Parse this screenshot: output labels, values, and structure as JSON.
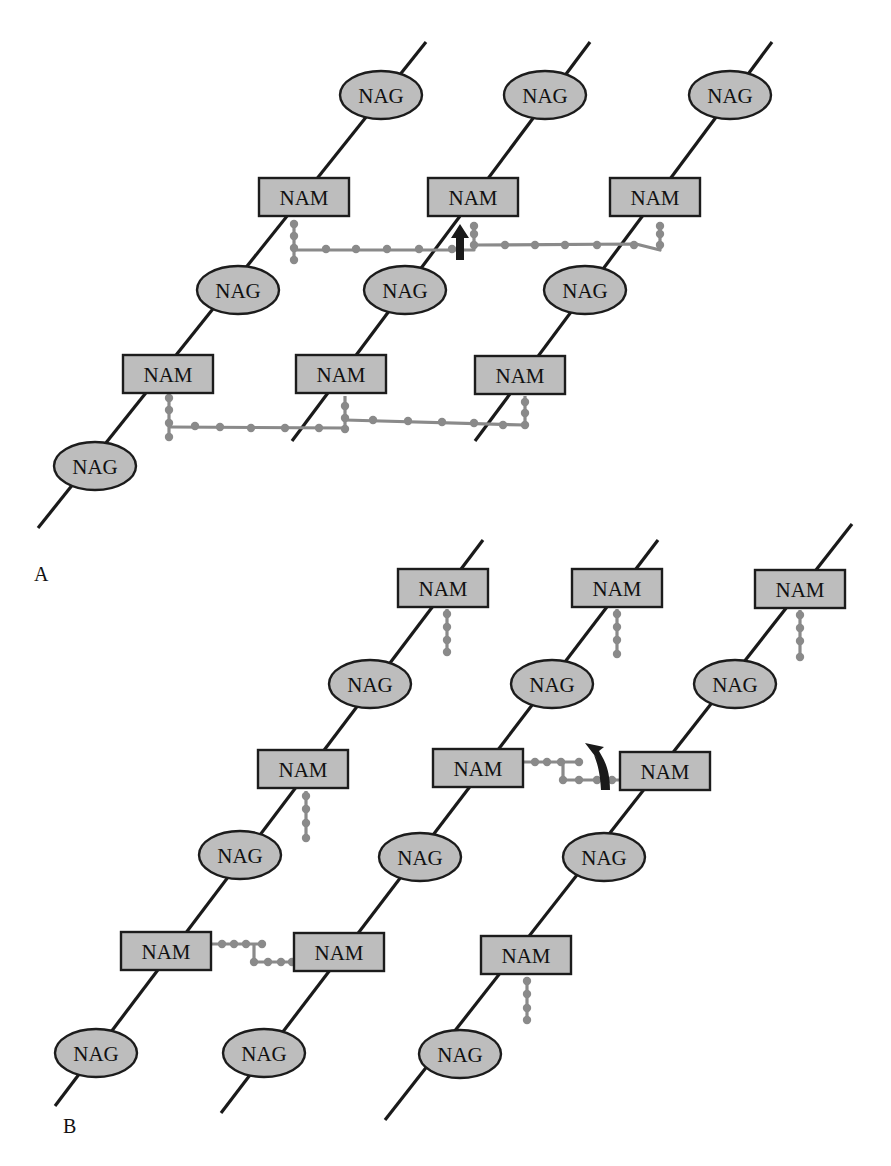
{
  "figure": {
    "panels": [
      {
        "id": "A",
        "label": "A",
        "label_pos": [
          34,
          575
        ],
        "strands": [
          {
            "from": [
              38,
              528
            ],
            "to": [
              426,
              42
            ]
          },
          {
            "from": [
              292,
              441
            ],
            "to": [
              590,
              42
            ]
          },
          {
            "from": [
              475,
              441
            ],
            "to": [
              772,
              42
            ]
          }
        ],
        "nodes": [
          {
            "type": "NAG",
            "text": "NAG",
            "cx": 381,
            "cy": 95
          },
          {
            "type": "NAG",
            "text": "NAG",
            "cx": 545,
            "cy": 95
          },
          {
            "type": "NAG",
            "text": "NAG",
            "cx": 730,
            "cy": 95
          },
          {
            "type": "NAM",
            "text": "NAM",
            "cx": 304,
            "cy": 197
          },
          {
            "type": "NAM",
            "text": "NAM",
            "cx": 473,
            "cy": 197
          },
          {
            "type": "NAM",
            "text": "NAM",
            "cx": 655,
            "cy": 197
          },
          {
            "type": "NAG",
            "text": "NAG",
            "cx": 238,
            "cy": 290
          },
          {
            "type": "NAG",
            "text": "NAG",
            "cx": 405,
            "cy": 290
          },
          {
            "type": "NAG",
            "text": "NAG",
            "cx": 585,
            "cy": 290
          },
          {
            "type": "NAM",
            "text": "NAM",
            "cx": 168,
            "cy": 374
          },
          {
            "type": "NAM",
            "text": "NAM",
            "cx": 341,
            "cy": 374
          },
          {
            "type": "NAM",
            "text": "NAM",
            "cx": 520,
            "cy": 375
          },
          {
            "type": "NAG",
            "text": "NAG",
            "cx": 95,
            "cy": 466
          }
        ],
        "peptides": [
          {
            "points": [
              [
                294,
                222
              ],
              [
                294,
                262
              ]
            ],
            "dots": [
              [
                294,
                224
              ],
              [
                294,
                236
              ],
              [
                294,
                248
              ],
              [
                294,
                260
              ]
            ]
          },
          {
            "points": [
              [
                294,
                250
              ],
              [
                474,
                250
              ],
              [
                474,
                222
              ]
            ],
            "dots": [
              [
                326,
                249
              ],
              [
                356,
                249
              ],
              [
                387,
                249
              ],
              [
                419,
                249
              ],
              [
                452,
                249
              ],
              [
                474,
                245
              ],
              [
                474,
                234
              ],
              [
                474,
                226
              ]
            ]
          },
          {
            "points": [
              [
                474,
                245
              ],
              [
                636,
                244
              ],
              [
                660,
                250
              ],
              [
                660,
                222
              ]
            ],
            "dots": [
              [
                505,
                245
              ],
              [
                535,
                245
              ],
              [
                565,
                245
              ],
              [
                597,
                245
              ],
              [
                634,
                245
              ],
              [
                660,
                245
              ],
              [
                660,
                234
              ],
              [
                660,
                226
              ]
            ]
          },
          {
            "points": [
              [
                169,
                395
              ],
              [
                169,
                437
              ]
            ],
            "dots": [
              [
                169,
                398
              ],
              [
                169,
                410
              ],
              [
                169,
                423
              ],
              [
                169,
                437
              ]
            ]
          },
          {
            "points": [
              [
                169,
                427
              ],
              [
                345,
                428
              ],
              [
                345,
                396
              ]
            ],
            "dots": [
              [
                195,
                426
              ],
              [
                220,
                427
              ],
              [
                251,
                428
              ],
              [
                285,
                428
              ],
              [
                319,
                428
              ],
              [
                345,
                429
              ],
              [
                345,
                418
              ],
              [
                345,
                406
              ]
            ]
          },
          {
            "points": [
              [
                345,
                420
              ],
              [
                525,
                425
              ],
              [
                525,
                396
              ]
            ],
            "dots": [
              [
                373,
                420
              ],
              [
                408,
                421
              ],
              [
                442,
                422
              ],
              [
                474,
                423
              ],
              [
                503,
                425
              ],
              [
                525,
                425
              ],
              [
                525,
                413
              ],
              [
                525,
                402
              ]
            ]
          }
        ],
        "arrows": [
          {
            "kind": "straight-up",
            "x": 460,
            "y": 224,
            "length": 36
          }
        ]
      },
      {
        "id": "B",
        "label": "B",
        "label_pos": [
          63,
          1127
        ],
        "strands": [
          {
            "from": [
              55,
              1106
            ],
            "to": [
              483,
              540
            ]
          },
          {
            "from": [
              221,
              1113
            ],
            "to": [
              658,
              540
            ]
          },
          {
            "from": [
              385,
              1120
            ],
            "to": [
              852,
              524
            ]
          }
        ],
        "nodes": [
          {
            "type": "NAM",
            "text": "NAM",
            "cx": 443,
            "cy": 588
          },
          {
            "type": "NAM",
            "text": "NAM",
            "cx": 617,
            "cy": 588
          },
          {
            "type": "NAM",
            "text": "NAM",
            "cx": 800,
            "cy": 589
          },
          {
            "type": "NAG",
            "text": "NAG",
            "cx": 370,
            "cy": 684
          },
          {
            "type": "NAG",
            "text": "NAG",
            "cx": 552,
            "cy": 684
          },
          {
            "type": "NAG",
            "text": "NAG",
            "cx": 735,
            "cy": 684
          },
          {
            "type": "NAM",
            "text": "NAM",
            "cx": 303,
            "cy": 769
          },
          {
            "type": "NAM",
            "text": "NAM",
            "cx": 478,
            "cy": 768
          },
          {
            "type": "NAM",
            "text": "NAM",
            "cx": 665,
            "cy": 771
          },
          {
            "type": "NAG",
            "text": "NAG",
            "cx": 240,
            "cy": 855
          },
          {
            "type": "NAG",
            "text": "NAG",
            "cx": 420,
            "cy": 857
          },
          {
            "type": "NAG",
            "text": "NAG",
            "cx": 604,
            "cy": 857
          },
          {
            "type": "NAM",
            "text": "NAM",
            "cx": 166,
            "cy": 951
          },
          {
            "type": "NAM",
            "text": "NAM",
            "cx": 339,
            "cy": 952
          },
          {
            "type": "NAM",
            "text": "NAM",
            "cx": 526,
            "cy": 955
          },
          {
            "type": "NAG",
            "text": "NAG",
            "cx": 96,
            "cy": 1053
          },
          {
            "type": "NAG",
            "text": "NAG",
            "cx": 264,
            "cy": 1053
          },
          {
            "type": "NAG",
            "text": "NAG",
            "cx": 460,
            "cy": 1054
          }
        ],
        "peptides": [
          {
            "points": [
              [
                447,
                609
              ],
              [
                447,
                652
              ]
            ],
            "dots": [
              [
                447,
                614
              ],
              [
                447,
                627
              ],
              [
                447,
                640
              ],
              [
                447,
                652
              ]
            ]
          },
          {
            "points": [
              [
                617,
                609
              ],
              [
                617,
                654
              ]
            ],
            "dots": [
              [
                617,
                614
              ],
              [
                617,
                627
              ],
              [
                617,
                640
              ],
              [
                617,
                654
              ]
            ]
          },
          {
            "points": [
              [
                800,
                610
              ],
              [
                800,
                657
              ]
            ],
            "dots": [
              [
                800,
                615
              ],
              [
                800,
                628
              ],
              [
                800,
                641
              ],
              [
                800,
                657
              ]
            ]
          },
          {
            "points": [
              [
                306,
                791
              ],
              [
                306,
                838
              ]
            ],
            "dots": [
              [
                306,
                796
              ],
              [
                306,
                809
              ],
              [
                306,
                823
              ],
              [
                306,
                838
              ]
            ]
          },
          {
            "points": [
              [
                524,
                762
              ],
              [
                579,
                762
              ],
              [
                563,
                762
              ],
              [
                563,
                780
              ],
              [
                620,
                780
              ]
            ],
            "dots": [
              [
                535,
                762
              ],
              [
                547,
                762
              ],
              [
                561,
                762
              ],
              [
                579,
                762
              ],
              [
                563,
                780
              ],
              [
                579,
                780
              ],
              [
                597,
                780
              ],
              [
                612,
                780
              ]
            ]
          },
          {
            "points": [
              [
                527,
                977
              ],
              [
                527,
                1020
              ]
            ],
            "dots": [
              [
                527,
                981
              ],
              [
                527,
                994
              ],
              [
                527,
                1008
              ],
              [
                527,
                1020
              ]
            ]
          },
          {
            "points": [
              [
                212,
                944
              ],
              [
                262,
                944
              ],
              [
                254,
                944
              ],
              [
                254,
                962
              ],
              [
                294,
                962
              ]
            ],
            "dots": [
              [
                222,
                944
              ],
              [
                234,
                944
              ],
              [
                246,
                944
              ],
              [
                262,
                944
              ],
              [
                254,
                962
              ],
              [
                268,
                962
              ],
              [
                281,
                962
              ],
              [
                292,
                962
              ]
            ]
          }
        ],
        "arrows": [
          {
            "kind": "curved",
            "x": 605,
            "y": 790,
            "tip": [
              585,
              743
            ]
          }
        ]
      }
    ],
    "legend": {
      "nag_full_name": "N-acetylglucosamine",
      "nam_full_name": "N-acetylmuramic acid"
    }
  },
  "style": {
    "fill_gray": "#bdbdbd",
    "peptide_gray": "#8a8a8a",
    "stroke_dark": "#1c1c1c"
  }
}
